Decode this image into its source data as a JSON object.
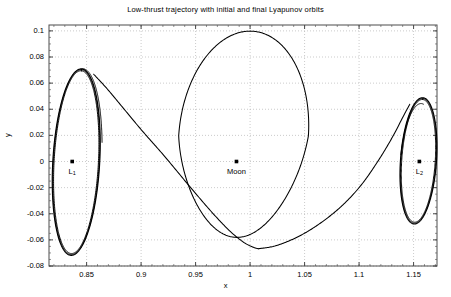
{
  "title": "Low-thrust trajectory with initial and final Lyapunov orbits",
  "axes": {
    "xlabel": "x",
    "ylabel": "y",
    "xticks": [
      "0.85",
      "0.9",
      "0.95",
      "1",
      "1.05",
      "1.1",
      "1.15"
    ],
    "xtickvals": [
      0.85,
      0.9,
      0.95,
      1.0,
      1.05,
      1.1,
      1.15
    ],
    "yticks": [
      "0.1",
      "0.08",
      "0.06",
      "0.04",
      "0.02",
      "0",
      "-0.02",
      "-0.04",
      "-0.06",
      "-0.08"
    ],
    "ytickvals": [
      0.1,
      0.08,
      0.06,
      0.04,
      0.02,
      0,
      -0.02,
      -0.04,
      -0.06,
      -0.08
    ],
    "xlim": [
      0.8155,
      1.1715
    ],
    "ylim": [
      -0.08,
      0.1045
    ],
    "grid": true,
    "grid_color": "#b4b4b4",
    "frame_color": "#4d4d4d",
    "line_color": "#000000",
    "background": "#ffffff"
  },
  "annotations": [
    {
      "name": "L1",
      "label": "L",
      "subscript": "1",
      "x": 0.8368,
      "y": 0.0
    },
    {
      "name": "Moon",
      "label": "Moon",
      "subscript": "",
      "x": 0.9875,
      "y": 0.0
    },
    {
      "name": "L2",
      "label": "L",
      "subscript": "2",
      "x": 1.1553,
      "y": 0.0
    }
  ],
  "chart_data": {
    "type": "line",
    "title": "Low-thrust trajectory with initial and final Lyapunov orbits",
    "xlabel": "x",
    "ylabel": "y",
    "xlim": [
      0.8155,
      1.1715
    ],
    "ylim": [
      -0.08,
      0.1045
    ],
    "grid": true,
    "legend": "none",
    "markers": [
      {
        "label": "L1",
        "x": 0.8368,
        "y": 0.0
      },
      {
        "label": "Moon",
        "x": 0.9875,
        "y": 0.0
      },
      {
        "label": "L2",
        "x": 1.1553,
        "y": 0.0
      }
    ],
    "series": [
      {
        "name": "Initial Lyapunov orbit about L1",
        "kind": "closed-ellipse",
        "center_x": 0.8405,
        "center_y": -0.0005,
        "semi_x": 0.0215,
        "semi_y": 0.0715,
        "tilt_deg": -4.0,
        "revolutions": 3,
        "x_range": [
          0.819,
          0.862
        ],
        "y_range": [
          -0.0725,
          0.0715
        ]
      },
      {
        "name": "Final Lyapunov orbit about L2",
        "kind": "closed-ellipse",
        "center_x": 1.1545,
        "center_y": 0.0005,
        "semi_x": 0.0165,
        "semi_y": 0.0485,
        "tilt_deg": -5.0,
        "revolutions": 3,
        "x_range": [
          1.138,
          1.171
        ],
        "y_range": [
          -0.048,
          0.0495
        ]
      },
      {
        "name": "Low-thrust transfer arc (L1 to Moon loop)",
        "kind": "open-arc",
        "points_x": [
          0.8565,
          0.869,
          0.884,
          0.901,
          0.921,
          0.943,
          0.9635,
          0.9805,
          0.9935,
          1.0025,
          1.0075
        ],
        "points_y": [
          0.0668,
          0.0555,
          0.0405,
          0.0235,
          0.0045,
          -0.0175,
          -0.0375,
          -0.0525,
          -0.0615,
          -0.0655,
          -0.0668
        ]
      },
      {
        "name": "Large loop around the Moon",
        "kind": "closed-loop",
        "apoapsis_y": 0.0998,
        "periapsis_y": -0.0605,
        "x_range": [
          0.9345,
          1.0535
        ],
        "top_x": 0.9985,
        "bottom_x": 1.0105
      },
      {
        "name": "Low-thrust transfer arc (Moon loop to L2)",
        "kind": "open-arc",
        "points_x": [
          1.0075,
          1.0235,
          1.0435,
          1.0635,
          1.0835,
          1.1015,
          1.1175,
          1.1305,
          1.1405,
          1.1465
        ],
        "points_y": [
          -0.0668,
          -0.0645,
          -0.0578,
          -0.0478,
          -0.0345,
          -0.0185,
          0.0005,
          0.0185,
          0.0345,
          0.0438
        ]
      }
    ]
  }
}
